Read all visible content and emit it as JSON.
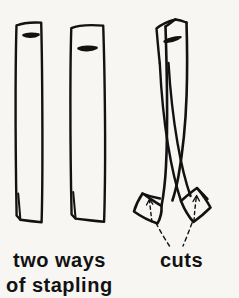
{
  "figure": {
    "medium": "hand-drawn line illustration",
    "background_color": "#f7f6f2",
    "ink_color": "#121212",
    "captions": {
      "line1": "two ways",
      "line2": "of stapling",
      "line3": "cuts"
    },
    "panels": [
      {
        "name": "left-panel",
        "caption": "two ways of stapling",
        "objects": [
          {
            "name": "strip-1",
            "description": "vertical paper strip with horizontal staple near top and slit at bottom",
            "staple_position": "upper",
            "staple_orientation": "horizontal",
            "bottom_slit": true
          },
          {
            "name": "strip-2",
            "description": "vertical paper strip with horizontal staple set lower and slit at bottom",
            "staple_position": "lower",
            "staple_orientation": "horizontal",
            "bottom_slit": true
          }
        ]
      },
      {
        "name": "right-panel",
        "caption": "cuts",
        "objects": [
          {
            "name": "crossed-strips",
            "description": "two stapled strips curving and crossing, splayed flaps at the bottom"
          },
          {
            "name": "cut-line-left",
            "description": "solid cut mark on left flap"
          },
          {
            "name": "cut-line-right",
            "description": "solid cut mark on right flap"
          },
          {
            "name": "cut-arrow-left",
            "description": "dashed arrow pointing up to left cut"
          },
          {
            "name": "cut-arrow-right",
            "description": "dashed arrow pointing up to right cut"
          },
          {
            "name": "leader-lines",
            "description": "two dashed leader lines from flaps converging down to the cuts label"
          }
        ]
      }
    ]
  }
}
